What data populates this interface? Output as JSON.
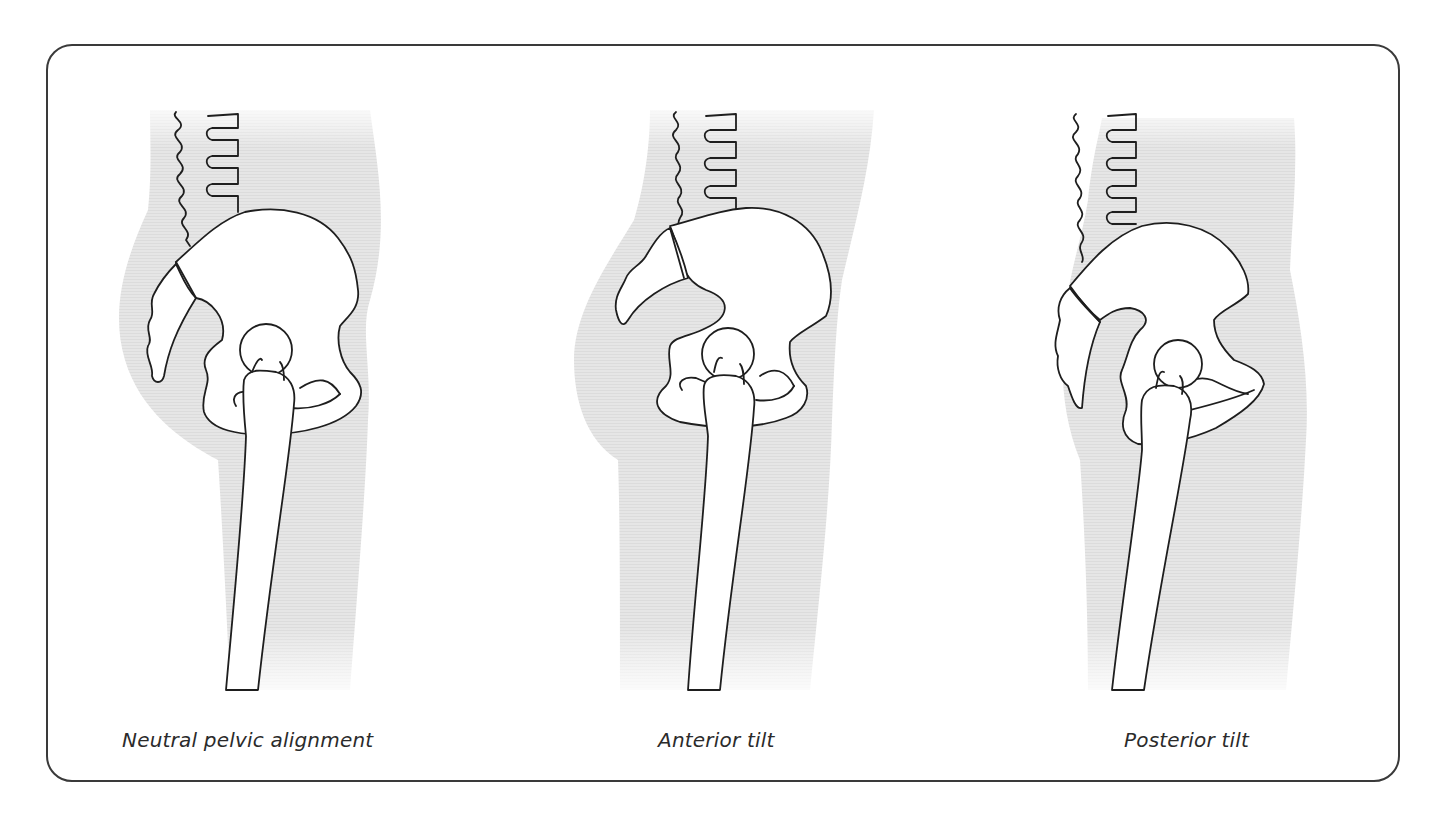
{
  "diagram": {
    "colors": {
      "frame_border": "#3a3a3a",
      "body_shading": "#e4e4e4",
      "bone_fill": "#ffffff",
      "outline": "#1e1e1e",
      "caption_text": "#2b2b2b"
    },
    "panels": [
      {
        "id": "neutral",
        "caption": "Neutral pelvic alignment",
        "elements": [
          "lumbar-spine",
          "sacrum",
          "coccyx",
          "ilium",
          "femoral-head",
          "femur",
          "body-silhouette"
        ]
      },
      {
        "id": "anterior",
        "caption": "Anterior tilt",
        "elements": [
          "lumbar-spine",
          "sacrum",
          "coccyx",
          "ilium",
          "femoral-head",
          "femur",
          "body-silhouette"
        ]
      },
      {
        "id": "posterior",
        "caption": "Posterior tilt",
        "elements": [
          "lumbar-spine",
          "sacrum",
          "coccyx",
          "ilium",
          "femoral-head",
          "femur",
          "body-silhouette"
        ]
      }
    ]
  }
}
